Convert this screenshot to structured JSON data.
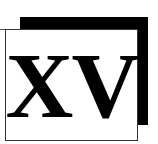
{
  "logo": {
    "text": "XV",
    "colors": {
      "shadow": "#000000",
      "box": "#ffffff",
      "text": "#000000"
    }
  }
}
